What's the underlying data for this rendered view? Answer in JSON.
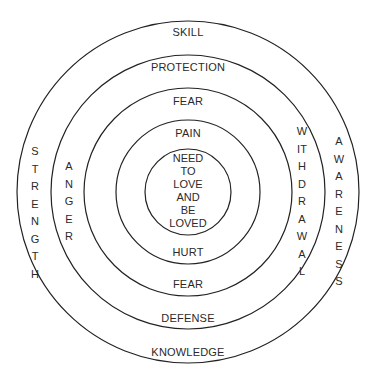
{
  "diagram": {
    "type": "concentric-circles",
    "center": {
      "x": 188,
      "y": 192
    },
    "rings": [
      {
        "name": "outer",
        "radius": 171
      },
      {
        "name": "second",
        "radius": 137
      },
      {
        "name": "third",
        "radius": 104
      },
      {
        "name": "fourth",
        "radius": 72
      },
      {
        "name": "inner",
        "radius": 43
      }
    ],
    "stroke_color": "#222222",
    "center_text": [
      "NEED",
      "TO",
      "LOVE",
      "AND",
      "BE",
      "LOVED"
    ],
    "top_labels": {
      "outer_band": "SKILL",
      "second_band": "PROTECTION",
      "third_band": "FEAR",
      "fourth_band": "PAIN"
    },
    "bottom_labels": {
      "fourth_band": "HURT",
      "third_band": "FEAR",
      "second_band": "DEFENSE",
      "outer_band": "KNOWLEDGE"
    },
    "left_labels": {
      "outer_band": "STRENGTH",
      "second_band": "ANGER"
    },
    "right_labels": {
      "second_band": "WITHDRAWAL",
      "outer_band": "AWARENESS"
    }
  }
}
